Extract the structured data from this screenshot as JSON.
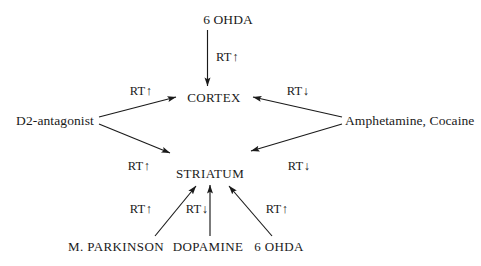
{
  "diagram": {
    "background_color": "#ffffff",
    "ink_color": "#1a1a1a",
    "nodes": {
      "top_source": "6 OHDA",
      "cortex": "CORTEX",
      "striatum": "STRIATUM",
      "left_source": "D2-antagonist",
      "right_source": "Amphetamine, Cocaine",
      "bottom_left_source": "M. PARKINSON",
      "bottom_middle_source": "DOPAMINE",
      "bottom_right_source": "6 OHDA"
    },
    "edges": [
      {
        "id": "ohda-to-cortex",
        "from": "6 OHDA",
        "to": "CORTEX",
        "label": "RT",
        "direction": "↑"
      },
      {
        "id": "d2-to-cortex",
        "from": "D2-antagonist",
        "to": "CORTEX",
        "label": "RT",
        "direction": "↑"
      },
      {
        "id": "amph-to-cortex",
        "from": "Amphetamine, Cocaine",
        "to": "CORTEX",
        "label": "RT",
        "direction": "↓"
      },
      {
        "id": "d2-to-striatum",
        "from": "D2-antagonist",
        "to": "STRIATUM",
        "label": "RT",
        "direction": "↑"
      },
      {
        "id": "amph-to-striatum",
        "from": "Amphetamine, Cocaine",
        "to": "STRIATUM",
        "label": "RT",
        "direction": "↓"
      },
      {
        "id": "parkinson-to-striatum",
        "from": "M. PARKINSON",
        "to": "STRIATUM",
        "label": "RT",
        "direction": "↑"
      },
      {
        "id": "dopamine-to-striatum",
        "from": "DOPAMINE",
        "to": "STRIATUM",
        "label": "RT",
        "direction": "↓"
      },
      {
        "id": "ohda-bottom-to-striatum",
        "from": "6 OHDA",
        "to": "STRIATUM",
        "label": "RT",
        "direction": "↑"
      }
    ]
  }
}
